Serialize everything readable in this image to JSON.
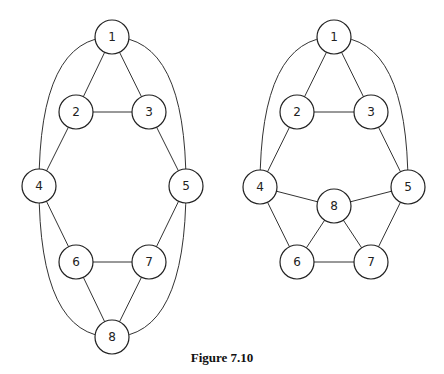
{
  "figure": {
    "caption": "Figure 7.10"
  },
  "graphs": [
    {
      "name": "left-graph",
      "nodes": [
        {
          "id": "1",
          "label": "1",
          "x": 112,
          "y": 37
        },
        {
          "id": "2",
          "label": "2",
          "x": 76,
          "y": 112
        },
        {
          "id": "3",
          "label": "3",
          "x": 149,
          "y": 112
        },
        {
          "id": "4",
          "label": "4",
          "x": 39,
          "y": 186
        },
        {
          "id": "5",
          "label": "5",
          "x": 186,
          "y": 186
        },
        {
          "id": "6",
          "label": "6",
          "x": 76,
          "y": 262
        },
        {
          "id": "7",
          "label": "7",
          "x": 149,
          "y": 262
        },
        {
          "id": "8",
          "label": "8",
          "x": 112,
          "y": 337
        }
      ],
      "edges": [
        {
          "from": "1",
          "to": "2",
          "type": "line"
        },
        {
          "from": "1",
          "to": "3",
          "type": "line"
        },
        {
          "from": "2",
          "to": "3",
          "type": "line"
        },
        {
          "from": "2",
          "to": "4",
          "type": "line"
        },
        {
          "from": "3",
          "to": "5",
          "type": "line"
        },
        {
          "from": "4",
          "to": "6",
          "type": "line"
        },
        {
          "from": "5",
          "to": "7",
          "type": "line"
        },
        {
          "from": "6",
          "to": "7",
          "type": "line"
        },
        {
          "from": "6",
          "to": "8",
          "type": "line"
        },
        {
          "from": "7",
          "to": "8",
          "type": "line"
        },
        {
          "from": "1",
          "to": "4",
          "type": "curve"
        },
        {
          "from": "1",
          "to": "5",
          "type": "curve"
        },
        {
          "from": "4",
          "to": "8",
          "type": "curve"
        },
        {
          "from": "5",
          "to": "8",
          "type": "curve"
        }
      ]
    },
    {
      "name": "right-graph",
      "nodes": [
        {
          "id": "1",
          "label": "1",
          "x": 334,
          "y": 37
        },
        {
          "id": "2",
          "label": "2",
          "x": 297,
          "y": 112
        },
        {
          "id": "3",
          "label": "3",
          "x": 371,
          "y": 112
        },
        {
          "id": "4",
          "label": "4",
          "x": 260,
          "y": 187
        },
        {
          "id": "5",
          "label": "5",
          "x": 408,
          "y": 187
        },
        {
          "id": "8",
          "label": "8",
          "x": 334,
          "y": 206
        },
        {
          "id": "6",
          "label": "6",
          "x": 297,
          "y": 262
        },
        {
          "id": "7",
          "label": "7",
          "x": 371,
          "y": 262
        }
      ],
      "edges": [
        {
          "from": "1",
          "to": "2",
          "type": "line"
        },
        {
          "from": "1",
          "to": "3",
          "type": "line"
        },
        {
          "from": "2",
          "to": "3",
          "type": "line"
        },
        {
          "from": "2",
          "to": "4",
          "type": "line"
        },
        {
          "from": "3",
          "to": "5",
          "type": "line"
        },
        {
          "from": "4",
          "to": "8",
          "type": "line"
        },
        {
          "from": "5",
          "to": "8",
          "type": "line"
        },
        {
          "from": "4",
          "to": "6",
          "type": "line"
        },
        {
          "from": "5",
          "to": "7",
          "type": "line"
        },
        {
          "from": "8",
          "to": "6",
          "type": "line"
        },
        {
          "from": "8",
          "to": "7",
          "type": "line"
        },
        {
          "from": "6",
          "to": "7",
          "type": "line"
        },
        {
          "from": "1",
          "to": "4",
          "type": "curve"
        },
        {
          "from": "1",
          "to": "5",
          "type": "curve"
        }
      ]
    }
  ],
  "style": {
    "node_radius": 17,
    "stroke_color": "#222222",
    "background": "#ffffff"
  }
}
